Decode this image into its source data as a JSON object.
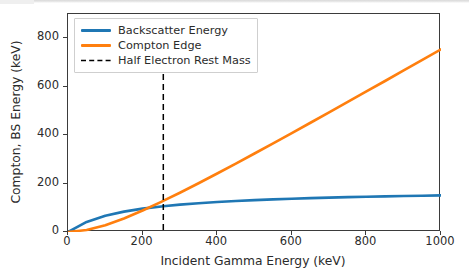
{
  "chart_data": {
    "type": "line",
    "title": "",
    "xlabel": "Incident Gamma Energy (keV)",
    "ylabel": "Compton, BS Energy (keV)",
    "xlim": [
      0,
      1000
    ],
    "ylim": [
      0,
      900
    ],
    "grid": false,
    "legend_position": "upper left",
    "xticks": [
      0,
      200,
      400,
      600,
      800,
      1000
    ],
    "xticklabels": [
      "0",
      "200",
      "400",
      "600",
      "800",
      "1000"
    ],
    "yticks": [
      0,
      200,
      400,
      600,
      800
    ],
    "yticklabels": [
      "0",
      "200",
      "400",
      "600",
      "800"
    ],
    "series": [
      {
        "name": "Backscatter Energy",
        "color": "#1f77b4",
        "style": "solid",
        "x": [
          0,
          50,
          100,
          150,
          200,
          250,
          255,
          300,
          350,
          400,
          450,
          500,
          550,
          600,
          650,
          700,
          750,
          800,
          850,
          900,
          950,
          1000
        ],
        "values": [
          0,
          41.7,
          67.1,
          84.1,
          96.4,
          105.6,
          106.4,
          112.9,
          118.9,
          123.9,
          128.1,
          131.7,
          134.8,
          137.5,
          139.9,
          142.0,
          143.9,
          145.6,
          147.2,
          148.6,
          149.9,
          151.1
        ]
      },
      {
        "name": "Compton Edge",
        "color": "#ff7f0e",
        "style": "solid",
        "x": [
          0,
          50,
          100,
          150,
          200,
          250,
          255,
          300,
          350,
          400,
          450,
          500,
          550,
          600,
          650,
          700,
          750,
          800,
          850,
          900,
          950,
          1000
        ],
        "values": [
          0,
          8.3,
          28.1,
          56.0,
          88.7,
          124.5,
          128.2,
          162.2,
          201.4,
          241.6,
          282.6,
          324.1,
          366.1,
          408.4,
          451.0,
          493.9,
          536.9,
          580.1,
          623.4,
          666.8,
          710.4,
          754.0
        ]
      }
    ],
    "annotations": [
      {
        "name": "Half Electron Rest Mass",
        "type": "vline",
        "x": 255.5,
        "color": "#000000",
        "style": "dashed"
      }
    ],
    "legend": [
      {
        "label": "Backscatter Energy",
        "color": "#1f77b4",
        "style": "solid"
      },
      {
        "label": "Compton Edge",
        "color": "#ff7f0e",
        "style": "solid"
      },
      {
        "label": "Half Electron Rest Mass",
        "color": "#000000",
        "style": "dashed"
      }
    ]
  }
}
